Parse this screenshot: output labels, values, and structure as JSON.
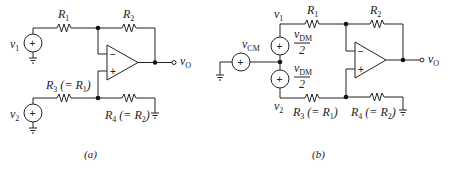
{
  "figure": {
    "panels": [
      {
        "id": "a",
        "caption": "(a)",
        "labels": {
          "v1": "v",
          "v1_sub": "1",
          "v2": "v",
          "v2_sub": "2",
          "R1": "R",
          "R1_sub": "1",
          "R2": "R",
          "R2_sub": "2",
          "R3_pre": "R",
          "R3_sub": "3",
          "R3_mid": " (= R",
          "R3_sub2": "1",
          "R3_post": ")",
          "R4_pre": "R",
          "R4_sub": "4",
          "R4_mid": " (= R",
          "R4_sub2": "2",
          "R4_post": ")",
          "vO": "v",
          "vO_sub": "O",
          "opamp_minus": "−",
          "opamp_plus": "+",
          "src_plus": "+"
        }
      },
      {
        "id": "b",
        "caption": "(b)",
        "labels": {
          "v1": "v",
          "v1_sub": "1",
          "v2": "v",
          "v2_sub": "2",
          "vCM": "v",
          "vCM_sub": "CM",
          "vDM_top": "v",
          "vDM_top_sub": "DM",
          "vDM_top_den": "2",
          "vDM_bot": "v",
          "vDM_bot_sub": "DM",
          "vDM_bot_den": "2",
          "R1": "R",
          "R1_sub": "1",
          "R2": "R",
          "R2_sub": "2",
          "R3_pre": "R",
          "R3_sub": "3",
          "R3_mid": " (= R",
          "R3_sub2": "1",
          "R3_post": ")",
          "R4_pre": "R",
          "R4_sub": "4",
          "R4_mid": " (= R",
          "R4_sub2": "2",
          "R4_post": ")",
          "vO": "v",
          "vO_sub": "O",
          "opamp_minus": "−",
          "opamp_plus": "+",
          "src_plus": "+"
        }
      }
    ]
  }
}
